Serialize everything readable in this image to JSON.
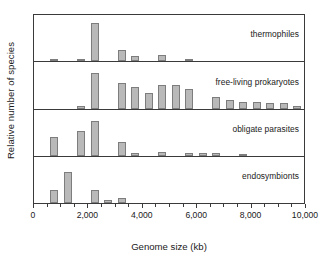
{
  "chart_data": {
    "type": "bar",
    "title": "",
    "xlabel": "Genome size (kb)",
    "ylabel": "Relative number of species",
    "xlim": [
      0,
      10000
    ],
    "xticks": [
      0,
      2000,
      4000,
      6000,
      8000,
      10000
    ],
    "xticklabels": [
      "0",
      "2,000",
      "4,000",
      "6,000",
      "8,000",
      "10,000"
    ],
    "minor_tick_interval": 500,
    "bin_width": 500,
    "grid": false,
    "legend_position": "inside-right-of-each-panel",
    "bar_fill": "#b9b9b9",
    "bar_edge": "#7d7d7d",
    "axis_color": "#3a3a3a",
    "ylim": [
      0,
      1
    ],
    "ylabel_note": "Relative frequency, axis unlabeled on each panel",
    "panels": [
      {
        "name": "thermophiles",
        "label": "thermophiles",
        "x": [
          250,
          750,
          1250,
          1750,
          2250,
          2750,
          3250,
          3750,
          4250,
          4750,
          5250,
          5750,
          6250,
          6750,
          7250,
          7750,
          8250,
          8750,
          9250,
          9750
        ],
        "values": [
          0.0,
          0.04,
          0.0,
          0.04,
          0.93,
          0.0,
          0.27,
          0.13,
          0.0,
          0.15,
          0.0,
          0.05,
          0.0,
          0.0,
          0.0,
          0.0,
          0.0,
          0.0,
          0.0,
          0.0
        ]
      },
      {
        "name": "free-living prokaryotes",
        "label": "free-living prokaryotes",
        "x": [
          250,
          750,
          1250,
          1750,
          2250,
          2750,
          3250,
          3750,
          4250,
          4750,
          5250,
          5750,
          6250,
          6750,
          7250,
          7750,
          8250,
          8750,
          9250,
          9750
        ],
        "values": [
          0.0,
          0.0,
          0.0,
          0.07,
          0.88,
          0.0,
          0.62,
          0.52,
          0.37,
          0.58,
          0.58,
          0.49,
          0.0,
          0.29,
          0.22,
          0.15,
          0.15,
          0.14,
          0.14,
          0.06
        ],
        "values_note": "bars at 500 kb bin centers across 0-10000"
      },
      {
        "name": "obligate parasites",
        "label": "obligate parasites",
        "x": [
          250,
          750,
          1250,
          1750,
          2250,
          2750,
          3250,
          3750,
          4250,
          4750,
          5250,
          5750,
          6250,
          6750,
          7250,
          7750,
          8250,
          8750,
          9250,
          9750
        ],
        "values": [
          0.0,
          0.46,
          0.0,
          0.62,
          0.86,
          0.0,
          0.35,
          0.06,
          0.0,
          0.1,
          0.0,
          0.07,
          0.07,
          0.07,
          0.0,
          0.04,
          0.0,
          0.0,
          0.0,
          0.0
        ]
      },
      {
        "name": "endosymbionts",
        "label": "endosymbionts",
        "x": [
          250,
          750,
          1250,
          1750,
          2250,
          2750,
          3250,
          3750,
          4250,
          4750,
          5250,
          5750,
          6250,
          6750,
          7250,
          7750,
          8250,
          8750,
          9250,
          9750
        ],
        "values": [
          0.0,
          0.33,
          0.77,
          0.0,
          0.33,
          0.08,
          0.12,
          0.0,
          0.0,
          0.0,
          0.0,
          0.0,
          0.0,
          0.0,
          0.0,
          0.0,
          0.0,
          0.0,
          0.0,
          0.0
        ]
      }
    ]
  },
  "axes": {
    "ylabel": "Relative number of species",
    "xlabel": "Genome size (kb)",
    "xticklabels": [
      "0",
      "2,000",
      "4,000",
      "6,000",
      "8,000",
      "10,000"
    ]
  },
  "panels": {
    "thermophiles": "thermophiles",
    "free_living": "free-living prokaryotes",
    "obligate": "obligate parasites",
    "endosymbionts": "endosymbionts"
  }
}
